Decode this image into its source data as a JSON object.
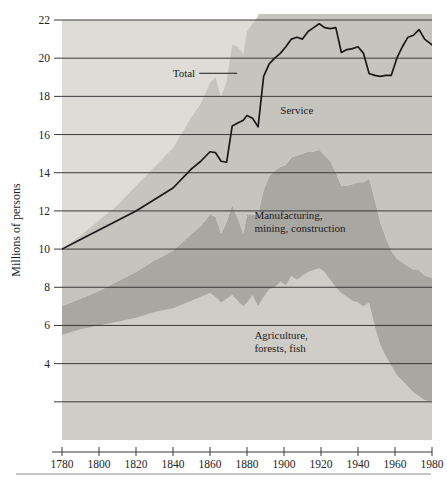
{
  "chart_data": {
    "type": "area",
    "title": "",
    "subtitle": "",
    "xlabel": "",
    "ylabel": "Millions of persons",
    "stacked": true,
    "grid": true,
    "legend_position": "inline-annotations",
    "xlim": [
      1780,
      1980
    ],
    "ylim": [
      0,
      22
    ],
    "xticks": [
      1780,
      1800,
      1820,
      1840,
      1860,
      1880,
      1900,
      1920,
      1940,
      1960,
      1980
    ],
    "xtick_labels": [
      "1780",
      "1800",
      "1820",
      "1840",
      "1860",
      "1880",
      "1900",
      "1920",
      "1940",
      "1960",
      "1980"
    ],
    "yticks": [
      2,
      4,
      6,
      8,
      10,
      12,
      14,
      16,
      18,
      20,
      22
    ],
    "ytick_labels": [
      "",
      "4",
      "6",
      "8",
      "10",
      "12",
      "14",
      "16",
      "18",
      "20",
      "22"
    ],
    "annotations": [
      {
        "text": "Total",
        "line1": "Total",
        "line2": "",
        "x": 1852,
        "y": 19.0,
        "leader": true
      },
      {
        "text": "Service",
        "line1": "Service",
        "line2": "",
        "x": 1898,
        "y": 17.1,
        "leader": false
      },
      {
        "text": "Manufacturing, mining, construction",
        "line1": "Manufacturing,",
        "line2": "mining, construction",
        "x": 1884,
        "y": 11.6,
        "leader": false
      },
      {
        "text": "Agriculture, forests, fish",
        "line1": "Agriculture,",
        "line2": "forests, fish",
        "x": 1884,
        "y": 5.3,
        "leader": false
      }
    ],
    "x": [
      1780,
      1790,
      1800,
      1810,
      1820,
      1830,
      1840,
      1850,
      1855,
      1860,
      1863,
      1866,
      1869,
      1872,
      1875,
      1878,
      1880,
      1883,
      1886,
      1889,
      1892,
      1895,
      1898,
      1901,
      1904,
      1907,
      1910,
      1913,
      1916,
      1919,
      1922,
      1925,
      1928,
      1931,
      1934,
      1937,
      1940,
      1943,
      1946,
      1949,
      1952,
      1955,
      1958,
      1961,
      1964,
      1967,
      1970,
      1973,
      1976,
      1980
    ],
    "series": [
      {
        "name": "Agriculture, forests, fish",
        "color": "#cfcdc8",
        "values": [
          5.5,
          5.8,
          6.0,
          6.2,
          6.4,
          6.7,
          6.9,
          7.3,
          7.5,
          7.7,
          7.5,
          7.2,
          7.4,
          7.6,
          7.3,
          7.0,
          7.2,
          7.6,
          7.0,
          7.5,
          7.9,
          8.0,
          8.3,
          8.1,
          8.6,
          8.4,
          8.6,
          8.8,
          8.9,
          9.0,
          8.8,
          8.4,
          8.0,
          7.7,
          7.5,
          7.3,
          7.2,
          7.0,
          7.2,
          6.0,
          5.0,
          4.4,
          3.9,
          3.4,
          3.1,
          2.8,
          2.5,
          2.3,
          2.1,
          2.0
        ]
      },
      {
        "name": "Manufacturing, mining, construction",
        "color": "#a9a7a2",
        "values": [
          1.5,
          1.6,
          1.8,
          2.1,
          2.4,
          2.7,
          3.0,
          3.5,
          3.7,
          4.1,
          4.2,
          3.6,
          4.0,
          4.7,
          4.3,
          3.8,
          4.6,
          4.2,
          4.8,
          5.6,
          5.9,
          6.1,
          6.0,
          6.3,
          6.2,
          6.5,
          6.4,
          6.3,
          6.2,
          6.2,
          6.1,
          6.2,
          6.0,
          5.6,
          5.8,
          6.1,
          6.3,
          6.5,
          6.5,
          6.6,
          6.4,
          6.2,
          6.0,
          6.1,
          6.2,
          6.3,
          6.4,
          6.6,
          6.5,
          6.5
        ]
      },
      {
        "name": "Service",
        "color": "#c6c4bf",
        "values": [
          3.0,
          3.3,
          3.7,
          4.0,
          4.5,
          4.9,
          5.4,
          6.1,
          6.4,
          6.9,
          7.3,
          7.1,
          7.4,
          8.4,
          9.0,
          9.4,
          9.6,
          10.0,
          10.4,
          11.5,
          12.5,
          13.2,
          13.8,
          14.6,
          15.0,
          15.4,
          16.0,
          16.5,
          16.7,
          16.5,
          16.6,
          16.7,
          16.5,
          16.0,
          16.1,
          16.4,
          16.3,
          16.0,
          15.9,
          16.0,
          15.8,
          16.2,
          16.8,
          17.5,
          18.2,
          18.8,
          19.0,
          18.9,
          18.9,
          18.6
        ]
      }
    ],
    "total": {
      "name": "Total",
      "color": "#1a1a1a",
      "values": [
        10.0,
        10.7,
        11.5,
        12.3,
        13.3,
        14.3,
        15.3,
        16.9,
        17.6,
        18.7,
        19.0,
        17.9,
        18.8,
        20.7,
        20.6,
        20.2,
        21.4,
        21.8,
        22.2,
        24.6,
        26.3,
        27.3,
        28.1,
        29.0,
        29.8,
        30.3,
        31.0,
        31.6,
        31.8,
        31.7,
        31.5,
        31.3,
        30.5,
        29.3,
        29.4,
        29.8,
        29.8,
        29.5,
        29.6,
        28.6,
        27.2,
        26.8,
        26.7,
        27.0,
        27.5,
        27.9,
        27.9,
        27.8,
        27.5,
        27.1
      ]
    },
    "total_curve_y": [
      10.0,
      10.5,
      11.0,
      11.5,
      12.0,
      12.6,
      13.2,
      14.2,
      14.6,
      15.1,
      15.05,
      14.6,
      14.55,
      16.45,
      16.6,
      16.75,
      17.0,
      16.85,
      16.4,
      19.05,
      19.7,
      20.0,
      20.25,
      20.6,
      21.0,
      21.1,
      21.0,
      21.4,
      21.6,
      21.8,
      21.6,
      21.55,
      21.6,
      20.3,
      20.45,
      20.5,
      20.6,
      20.25,
      19.2,
      19.1,
      19.05,
      19.1,
      19.1,
      20.0,
      20.6,
      21.1,
      21.2,
      21.5,
      21.0,
      20.7
    ]
  },
  "figure": {
    "plot_left": 62,
    "plot_right": 432,
    "plot_top": 20,
    "plot_bottom": 440,
    "background": "#ffffff",
    "gridline_color": "#3a3a3a",
    "footer_rule": true
  }
}
